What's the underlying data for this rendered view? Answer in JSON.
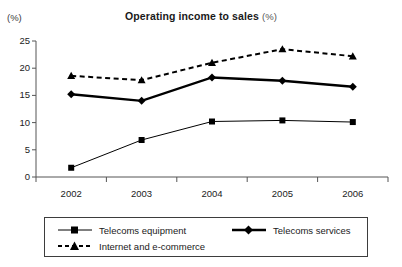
{
  "chart_data": {
    "type": "line",
    "title": "Operating income to sales",
    "title_unit": "(%)",
    "xlabel": "",
    "ylabel": "",
    "y_unit_label": "(%)",
    "categories": [
      "2002",
      "2003",
      "2004",
      "2005",
      "2006"
    ],
    "x": [
      2002,
      2003,
      2004,
      2005,
      2006
    ],
    "ylim": [
      0,
      25
    ],
    "y_ticks": [
      0,
      5,
      10,
      15,
      20,
      25
    ],
    "y_tick_labels": [
      "0",
      "5",
      "10",
      "15",
      "20",
      "25"
    ],
    "grid": false,
    "legend_position": "below-plot",
    "series": [
      {
        "name": "Telecoms equipment",
        "values": [
          1.7,
          6.8,
          10.2,
          10.4,
          10.1
        ],
        "marker": "square",
        "line_style": "solid",
        "line_width": 1,
        "color": "#000000"
      },
      {
        "name": "Telecoms services",
        "values": [
          15.2,
          14.0,
          18.3,
          17.7,
          16.6
        ],
        "marker": "diamond",
        "line_style": "solid",
        "line_width": 2.4,
        "color": "#000000"
      },
      {
        "name": "Internet and e-commerce",
        "values": [
          18.6,
          17.8,
          21.0,
          23.5,
          22.2
        ],
        "marker": "triangle",
        "line_style": "dashed",
        "line_width": 2.0,
        "color": "#000000"
      }
    ]
  },
  "legend": {
    "items": [
      {
        "label": "Telecoms equipment"
      },
      {
        "label": "Telecoms services"
      },
      {
        "label": "Internet and e-commerce"
      }
    ]
  }
}
